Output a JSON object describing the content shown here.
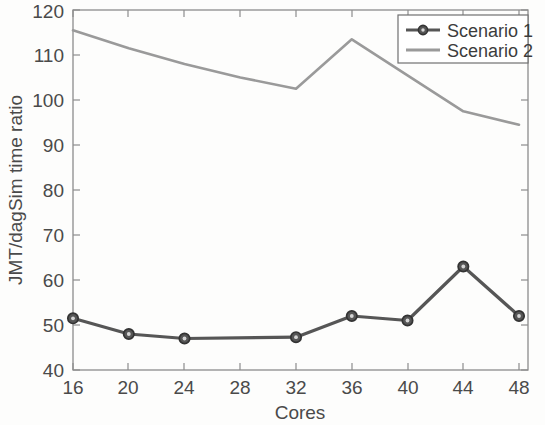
{
  "chart_data": {
    "type": "line",
    "title": "",
    "subtitle": "",
    "xlabel": "Cores",
    "ylabel": "JMT/dagSim time ratio",
    "x": [
      16,
      20,
      24,
      28,
      32,
      36,
      40,
      44,
      48
    ],
    "xticks": [
      "16",
      "20",
      "24",
      "28",
      "32",
      "36",
      "40",
      "44",
      "48"
    ],
    "yticks": [
      "40",
      "50",
      "60",
      "70",
      "80",
      "90",
      "100",
      "110",
      "120"
    ],
    "xlim": [
      16,
      48
    ],
    "ylim": [
      40,
      120
    ],
    "grid": false,
    "legend_position": "top-right",
    "series": [
      {
        "name": "Scenario 1",
        "color": "#565656",
        "marker": "circle",
        "values": [
          51.5,
          48.0,
          47.0,
          null,
          47.3,
          52.0,
          51.0,
          63.0,
          52.0
        ]
      },
      {
        "name": "Scenario 2",
        "color": "#9a9a9a",
        "marker": "none",
        "values": [
          115.5,
          111.5,
          108.0,
          105.0,
          102.5,
          113.5,
          105.5,
          97.5,
          94.5
        ]
      }
    ]
  },
  "axes": {
    "x_axis_title": "Cores",
    "y_axis_title": "JMT/dagSim time ratio"
  },
  "legend": {
    "entries": [
      {
        "label": "Scenario 1"
      },
      {
        "label": "Scenario 2"
      }
    ]
  },
  "colors": {
    "series_1": "#565656",
    "series_2": "#9a9a9a",
    "axis": "#8d8d8d",
    "text": "#4a4a4a",
    "background": "#fdfdfc"
  }
}
